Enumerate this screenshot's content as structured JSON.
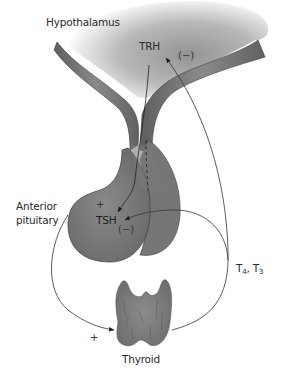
{
  "diagram": {
    "type": "endocrine-feedback-loop",
    "labels": {
      "hypothalamus": "Hypothalamus",
      "trh": "TRH",
      "anterior_pituitary_line1": "Anterior",
      "anterior_pituitary_line2": "pituitary",
      "tsh": "TSH",
      "thyroid": "Thyroid",
      "hormones_t4": "T",
      "hormones_t4_sub": "4",
      "hormones_sep": ", T",
      "hormones_t3_sub": "3"
    },
    "signs": {
      "trh_inhibition": "(−)",
      "tsh_stimulation": "+",
      "tsh_inhibition": "(−)",
      "thyroid_stimulation": "+"
    },
    "edges": [
      {
        "from": "Hypothalamus",
        "to": "Anterior pituitary",
        "label": "TRH",
        "sign": "+"
      },
      {
        "from": "Anterior pituitary",
        "to": "Thyroid",
        "label": "TSH",
        "sign": "+"
      },
      {
        "from": "Thyroid",
        "to": "Hypothalamus",
        "label": "T4, T3",
        "sign": "(−)"
      },
      {
        "from": "Thyroid",
        "to": "Anterior pituitary",
        "label": "T4, T3",
        "sign": "(−)"
      }
    ],
    "colors": {
      "tissue_dark": "#6b6b6b",
      "tissue_mid": "#8c8c8c",
      "hypothalamus_gradient_start": "#9a9a9a",
      "hypothalamus_gradient_end": "#ffffff",
      "line": "#3a3a3a",
      "text": "#2a2a2a"
    }
  }
}
